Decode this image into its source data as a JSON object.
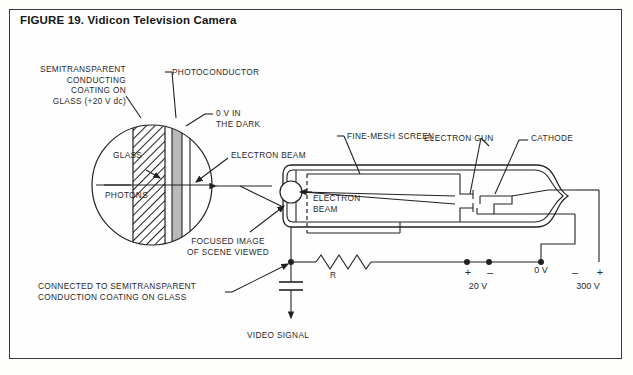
{
  "figure": {
    "title": "FIGURE 19. Vidicon Television Camera",
    "border_color": "#3a3a3a",
    "ink_color": "#222222",
    "photoconductor_fill": "#b9b9b9"
  },
  "labels": {
    "semitransparent_coating": {
      "line1": "SEMITRANSPARENT",
      "line2": "CONDUCTING",
      "line3": "COATING ON",
      "line4": "GLASS (+20 V dc)"
    },
    "photoconductor": "PHOTOCONDUCTOR",
    "zero_volt_dark": {
      "line1": "0 V IN",
      "line2": "THE DARK"
    },
    "glass": "GLASS",
    "photons": "PHOTONS",
    "electron_beam_detail": "ELECTRON BEAM",
    "fine_mesh_screen": "FINE-MESH SCREEN",
    "electron_gun": "ELECTRON GUN",
    "cathode": "CATHODE",
    "electron_beam_tube": {
      "line1": "ELECTRON",
      "line2": "BEAM"
    },
    "focused_image": {
      "line1": "FOCUSED IMAGE",
      "line2": "OF SCENE VIEWED"
    },
    "connected_to_coating": {
      "line1": "CONNECTED TO SEMITRANSPARENT",
      "line2": "CONDUCTION COATING ON GLASS"
    },
    "resistor": "R",
    "video_signal": "VIDEO SIGNAL"
  },
  "supplies": {
    "supply_20v": {
      "plus": "+",
      "minus": "–",
      "value": "20 V"
    },
    "ground": {
      "value": "0 V"
    },
    "supply_300v": {
      "minus": "–",
      "plus": "+",
      "value": "300 V"
    }
  }
}
